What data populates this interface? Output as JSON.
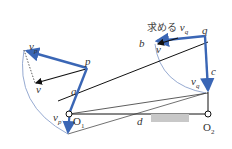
{
  "diagram": {
    "type": "four-bar linkage velocity diagram",
    "colors": {
      "link": "#3a66b5",
      "line": "#111111",
      "arc": "#8aa0cc",
      "ground_block": "#c8c8c8"
    },
    "labels": {
      "vp_top": "v",
      "vp_top_sub": "p",
      "p": "p",
      "v_left": "v",
      "a": "a",
      "vp_bottom": "v",
      "vp_bottom_sub": "p",
      "vp_bottom_prime": "'",
      "O1": "O",
      "O1_sub": "1",
      "d": "d",
      "O2": "O",
      "O2_sub": "2",
      "q": "q",
      "b": "b",
      "v_right": "v",
      "c": "c",
      "vq": "v",
      "vq_sub": "q",
      "goal_jp": "求める",
      "goal_v": "v",
      "goal_v_sub": "q"
    }
  }
}
